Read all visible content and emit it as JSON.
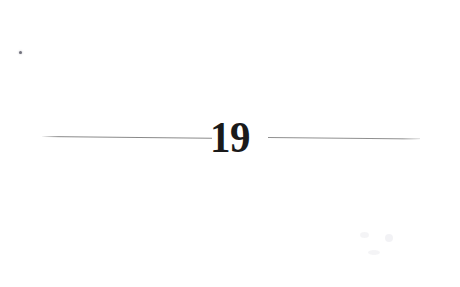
{
  "document": {
    "kind": "scanned-book-page",
    "page_label": "19",
    "background_color": "#ffffff",
    "ink_color": "#1a1a1a"
  },
  "divider": {
    "numeral": "19",
    "rule_color": "#8d8d8d",
    "left_rule": {
      "name": "left-rule",
      "start_x": 42,
      "end_x": 212,
      "y": 136
    },
    "right_rule": {
      "name": "right-rule",
      "start_x": 268,
      "end_x": 420,
      "y": 137
    }
  },
  "artifacts": {
    "top_left_speck": "scan-speck",
    "lower_right_smudges": "paper-texture"
  }
}
